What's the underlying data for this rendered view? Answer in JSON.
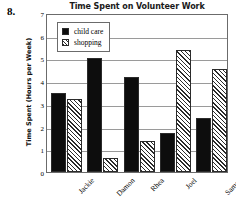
{
  "problem_number": "8.",
  "chart_data": {
    "type": "bar",
    "title": "Time Spent on Volunteer Work",
    "xlabel": "",
    "ylabel": "Time Spent (Hours per Week)",
    "ylim": [
      0,
      7
    ],
    "yticks": [
      "0",
      "1",
      "2",
      "3",
      "4",
      "5",
      "6",
      "7"
    ],
    "grid": true,
    "legend_position": "top-left-inside",
    "categories": [
      "Jackie",
      "Damon",
      "Rhea",
      "Joel",
      "Saman"
    ],
    "series": [
      {
        "name": "child care",
        "style": "solid-black",
        "color": "#0d0d0d",
        "values": [
          3.5,
          5.0,
          4.2,
          1.7,
          2.4
        ]
      },
      {
        "name": "shopping",
        "style": "diagonal-hatch",
        "color": "#2b2b2b",
        "values": [
          3.2,
          0.6,
          1.35,
          5.35,
          4.55
        ]
      }
    ]
  }
}
